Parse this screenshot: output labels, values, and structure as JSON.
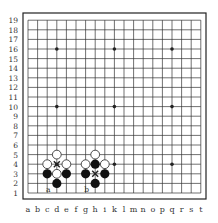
{
  "board": {
    "size": 19,
    "cols": [
      "a",
      "b",
      "c",
      "d",
      "e",
      "f",
      "g",
      "h",
      "i",
      "k",
      "l",
      "m",
      "n",
      "o",
      "p",
      "q",
      "r",
      "s",
      "t"
    ],
    "rows": [
      "1",
      "2",
      "3",
      "4",
      "5",
      "6",
      "7",
      "8",
      "9",
      "10",
      "11",
      "12",
      "13",
      "14",
      "15",
      "16",
      "17",
      "18",
      "19"
    ],
    "hoshi": [
      [
        3,
        3
      ],
      [
        9,
        3
      ],
      [
        15,
        3
      ],
      [
        3,
        9
      ],
      [
        9,
        9
      ],
      [
        15,
        9
      ],
      [
        3,
        15
      ],
      [
        9,
        15
      ],
      [
        15,
        15
      ]
    ],
    "white": [
      [
        3,
        4
      ],
      [
        2,
        3
      ],
      [
        4,
        3
      ],
      [
        3,
        2
      ],
      [
        7,
        4
      ],
      [
        6,
        3
      ],
      [
        8,
        3
      ]
    ],
    "black": [
      [
        2,
        2
      ],
      [
        4,
        2
      ],
      [
        3,
        1
      ],
      [
        7,
        3
      ],
      [
        6,
        2
      ],
      [
        8,
        2
      ],
      [
        7,
        1
      ]
    ],
    "crosses": [
      [
        3,
        3
      ],
      [
        7,
        2
      ]
    ],
    "labels": [
      {
        "text": "a",
        "c": 2,
        "r": 0
      },
      {
        "text": "b",
        "c": 6,
        "r": 0
      }
    ]
  }
}
